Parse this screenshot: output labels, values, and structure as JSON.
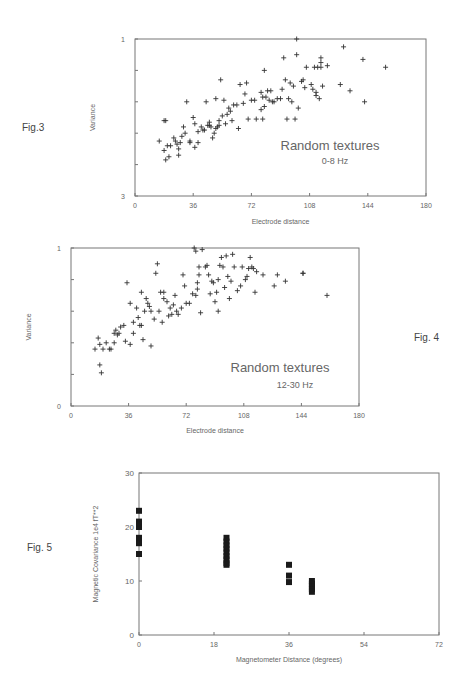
{
  "figures": [
    {
      "label": "Fig.3"
    },
    {
      "label": "Fig. 4"
    },
    {
      "label": "Fig. 5"
    }
  ],
  "chart_data": [
    {
      "type": "scatter",
      "figure": "Fig.3",
      "marker": "+",
      "title": "",
      "annotation": [
        "Random textures",
        "0-8 Hz"
      ],
      "xlabel": "Electrode distance",
      "ylabel": "Variance",
      "xlim": [
        0,
        180
      ],
      "ylim": [
        0,
        1
      ],
      "xticks": [
        "0",
        "36",
        "72",
        "108",
        "144",
        "180"
      ],
      "yticks_labeled": [
        "3",
        "1"
      ],
      "ytick_minor_step": 0.2,
      "grid": false,
      "points": [
        [
          15,
          0.35
        ],
        [
          18,
          0.29
        ],
        [
          18,
          0.48
        ],
        [
          19,
          0.48
        ],
        [
          19,
          0.23
        ],
        [
          20,
          0.32
        ],
        [
          21,
          0.25
        ],
        [
          22,
          0.32
        ],
        [
          24,
          0.37
        ],
        [
          25,
          0.35
        ],
        [
          26,
          0.33
        ],
        [
          27,
          0.26
        ],
        [
          27,
          0.3
        ],
        [
          28,
          0.34
        ],
        [
          29,
          0.38
        ],
        [
          30,
          0.44
        ],
        [
          31,
          0.4
        ],
        [
          32,
          0.6
        ],
        [
          34,
          0.34
        ],
        [
          34,
          0.35
        ],
        [
          36,
          0.5
        ],
        [
          37,
          0.31
        ],
        [
          37,
          0.46
        ],
        [
          39,
          0.41
        ],
        [
          39,
          0.34
        ],
        [
          41,
          0.44
        ],
        [
          42,
          0.42
        ],
        [
          43,
          0.42
        ],
        [
          44,
          0.6
        ],
        [
          45,
          0.45
        ],
        [
          46,
          0.45
        ],
        [
          46,
          0.47
        ],
        [
          47,
          0.44
        ],
        [
          48,
          0.37
        ],
        [
          49,
          0.4
        ],
        [
          50,
          0.43
        ],
        [
          50,
          0.62
        ],
        [
          51,
          0.44
        ],
        [
          52,
          0.45
        ],
        [
          52,
          0.48
        ],
        [
          53,
          0.74
        ],
        [
          54,
          0.51
        ],
        [
          55,
          0.61
        ],
        [
          56,
          0.46
        ],
        [
          57,
          0.52
        ],
        [
          58,
          0.56
        ],
        [
          59,
          0.54
        ],
        [
          60,
          0.48
        ],
        [
          61,
          0.58
        ],
        [
          63,
          0.58
        ],
        [
          64,
          0.43
        ],
        [
          65,
          0.71
        ],
        [
          67,
          0.59
        ],
        [
          68,
          0.65
        ],
        [
          69,
          0.72
        ],
        [
          70,
          0.49
        ],
        [
          72,
          0.61
        ],
        [
          74,
          0.61
        ],
        [
          75,
          0.49
        ],
        [
          78,
          0.55
        ],
        [
          78,
          0.66
        ],
        [
          79,
          0.49
        ],
        [
          79,
          0.63
        ],
        [
          80,
          0.57
        ],
        [
          80,
          0.8
        ],
        [
          81,
          0.63
        ],
        [
          82,
          0.67
        ],
        [
          83,
          0.61
        ],
        [
          84,
          0.67
        ],
        [
          85,
          0.6
        ],
        [
          86,
          0.6
        ],
        [
          88,
          0.62
        ],
        [
          90,
          0.62
        ],
        [
          91,
          0.68
        ],
        [
          92,
          0.88
        ],
        [
          93,
          0.74
        ],
        [
          94,
          0.49
        ],
        [
          95,
          0.62
        ],
        [
          96,
          0.72
        ],
        [
          97,
          0.6
        ],
        [
          98,
          0.7
        ],
        [
          99,
          0.49
        ],
        [
          100,
          0.9
        ],
        [
          101,
          0.56
        ],
        [
          103,
          0.73
        ],
        [
          104,
          0.74
        ],
        [
          105,
          0.69
        ],
        [
          106,
          0.82
        ],
        [
          109,
          0.71
        ],
        [
          110,
          0.68
        ],
        [
          111,
          0.82
        ],
        [
          112,
          0.66
        ],
        [
          112,
          0.64
        ],
        [
          113,
          0.82
        ],
        [
          114,
          0.62
        ],
        [
          115,
          0.82
        ],
        [
          115,
          0.85
        ],
        [
          115,
          0.88
        ],
        [
          116,
          0.7
        ],
        [
          119,
          0.83
        ],
        [
          127,
          0.71
        ],
        [
          129,
          0.95
        ],
        [
          133,
          0.67
        ],
        [
          141,
          0.87
        ],
        [
          142,
          0.6
        ],
        [
          155,
          0.82
        ],
        [
          100,
          1.0
        ]
      ]
    },
    {
      "type": "scatter",
      "figure": "Fig. 4",
      "marker": "+",
      "title": "",
      "annotation": [
        "Random textures",
        "12-30 Hz"
      ],
      "xlabel": "Electrode distance",
      "ylabel": "Variance",
      "xlim": [
        0,
        180
      ],
      "ylim": [
        0,
        1
      ],
      "xticks": [
        "0",
        "36",
        "72",
        "108",
        "144",
        "180"
      ],
      "yticks_labeled": [
        "0",
        "1"
      ],
      "ytick_minor_step": 0.2,
      "grid": false,
      "points": [
        [
          15,
          0.36
        ],
        [
          17,
          0.43
        ],
        [
          18,
          0.26
        ],
        [
          18,
          0.39
        ],
        [
          19,
          0.21
        ],
        [
          20,
          0.36
        ],
        [
          22,
          0.4
        ],
        [
          24,
          0.36
        ],
        [
          25,
          0.36
        ],
        [
          27,
          0.4
        ],
        [
          27,
          0.46
        ],
        [
          28,
          0.48
        ],
        [
          29,
          0.45
        ],
        [
          30,
          0.46
        ],
        [
          31,
          0.5
        ],
        [
          33,
          0.51
        ],
        [
          34,
          0.41
        ],
        [
          35,
          0.78
        ],
        [
          37,
          0.39
        ],
        [
          37,
          0.65
        ],
        [
          39,
          0.53
        ],
        [
          39,
          0.46
        ],
        [
          41,
          0.62
        ],
        [
          42,
          0.56
        ],
        [
          43,
          0.51
        ],
        [
          44,
          0.72
        ],
        [
          44,
          0.51
        ],
        [
          45,
          0.42
        ],
        [
          46,
          0.6
        ],
        [
          47,
          0.68
        ],
        [
          48,
          0.65
        ],
        [
          49,
          0.63
        ],
        [
          50,
          0.6
        ],
        [
          50,
          0.38
        ],
        [
          52,
          0.55
        ],
        [
          53,
          0.84
        ],
        [
          54,
          0.9
        ],
        [
          55,
          0.6
        ],
        [
          56,
          0.72
        ],
        [
          57,
          0.53
        ],
        [
          58,
          0.72
        ],
        [
          58,
          0.68
        ],
        [
          60,
          0.66
        ],
        [
          61,
          0.57
        ],
        [
          62,
          0.62
        ],
        [
          63,
          0.58
        ],
        [
          64,
          0.64
        ],
        [
          65,
          0.7
        ],
        [
          66,
          0.6
        ],
        [
          67,
          0.58
        ],
        [
          69,
          0.62
        ],
        [
          70,
          0.83
        ],
        [
          71,
          0.76
        ],
        [
          72,
          0.65
        ],
        [
          74,
          0.65
        ],
        [
          76,
          0.71
        ],
        [
          78,
          0.7
        ],
        [
          79,
          0.74
        ],
        [
          79,
          0.78
        ],
        [
          80,
          0.83
        ],
        [
          80,
          0.88
        ],
        [
          81,
          0.59
        ],
        [
          82,
          0.99
        ],
        [
          84,
          0.88
        ],
        [
          85,
          0.89
        ],
        [
          86,
          0.83
        ],
        [
          87,
          0.71
        ],
        [
          88,
          0.79
        ],
        [
          89,
          0.78
        ],
        [
          90,
          0.66
        ],
        [
          91,
          0.72
        ],
        [
          92,
          0.8
        ],
        [
          92,
          0.6
        ],
        [
          93,
          0.89
        ],
        [
          94,
          0.94
        ],
        [
          95,
          0.88
        ],
        [
          96,
          0.75
        ],
        [
          97,
          0.95
        ],
        [
          98,
          0.82
        ],
        [
          99,
          0.68
        ],
        [
          100,
          0.79
        ],
        [
          101,
          0.96
        ],
        [
          102,
          0.88
        ],
        [
          104,
          0.73
        ],
        [
          106,
          0.76
        ],
        [
          107,
          0.88
        ],
        [
          109,
          0.8
        ],
        [
          110,
          0.82
        ],
        [
          111,
          0.87
        ],
        [
          112,
          0.94
        ],
        [
          113,
          0.88
        ],
        [
          114,
          0.87
        ],
        [
          115,
          0.72
        ],
        [
          116,
          0.85
        ],
        [
          120,
          0.83
        ],
        [
          127,
          0.76
        ],
        [
          129,
          0.83
        ],
        [
          134,
          0.79
        ],
        [
          145,
          0.84
        ],
        [
          145,
          0.84
        ],
        [
          160,
          0.7
        ],
        [
          77,
          1.0
        ],
        [
          78,
          0.98
        ]
      ]
    },
    {
      "type": "scatter",
      "figure": "Fig. 5",
      "marker": "square",
      "title": "",
      "xlabel": "Magnetometer Distance (degrees)",
      "ylabel": "Magnetic Covariance 1e4 fT**2",
      "xlim": [
        0,
        72
      ],
      "ylim": [
        0,
        30
      ],
      "xticks": [
        "0",
        "18",
        "36",
        "54",
        "72"
      ],
      "yticks": [
        "0",
        "10",
        "20",
        "30"
      ],
      "grid": false,
      "points": [
        [
          0,
          23
        ],
        [
          0,
          21
        ],
        [
          0,
          20.5
        ],
        [
          0,
          20
        ],
        [
          0,
          18
        ],
        [
          0,
          17.5
        ],
        [
          0,
          17
        ],
        [
          0,
          15
        ],
        [
          21,
          18
        ],
        [
          21,
          17.3
        ],
        [
          21,
          16.6
        ],
        [
          21,
          16
        ],
        [
          21,
          15.3
        ],
        [
          21,
          14.6
        ],
        [
          21,
          14
        ],
        [
          21,
          13.3
        ],
        [
          21,
          13
        ],
        [
          36,
          13
        ],
        [
          36,
          11
        ],
        [
          36,
          9.8
        ],
        [
          41.5,
          10
        ],
        [
          41.5,
          9.5
        ],
        [
          41.5,
          9
        ],
        [
          41.5,
          8.5
        ],
        [
          41.5,
          8
        ]
      ]
    }
  ]
}
